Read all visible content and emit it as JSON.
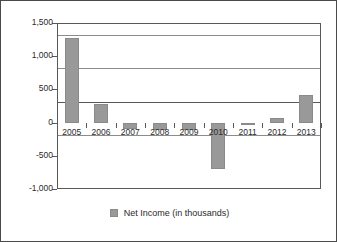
{
  "chart_data": {
    "type": "bar",
    "title": "",
    "subtitle": "",
    "xlabel": "",
    "ylabel": "",
    "categories": [
      "2005",
      "2006",
      "2007",
      "2008",
      "2009",
      "2010",
      "2011",
      "2012",
      "2013"
    ],
    "series": [
      {
        "name": "Net Income (in thousands)",
        "values": [
          1280,
          285,
          -95,
          -105,
          -105,
          -700,
          -40,
          65,
          410
        ],
        "color": "#999999"
      }
    ],
    "ylim": [
      -1000,
      1500
    ],
    "yticks": [
      1500,
      1000,
      500,
      0,
      -500,
      -1000
    ],
    "ytick_labels": [
      "1,500",
      "1,000",
      "500",
      "0",
      "-500",
      "-1,000"
    ],
    "grid": true,
    "grid_axis": "y",
    "legend": {
      "position": "bottom-center",
      "entries": [
        {
          "label": "Net Income (in thousands)",
          "swatch": "legend-color-swatch",
          "color": "#999999"
        }
      ]
    }
  },
  "style": {
    "bar_color": "#999999",
    "gridline_color": "#8c8c8c",
    "axis_color": "#595959",
    "border_color": "#4a4a4a",
    "background": "#ffffff",
    "text_color": "#2b2b2b"
  }
}
